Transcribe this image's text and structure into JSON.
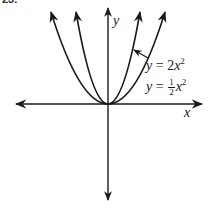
{
  "figure": {
    "problem_number": "23.",
    "axes": {
      "x_label": "x",
      "y_label": "y"
    },
    "curves": [
      {
        "name": "y = 2x^2",
        "label_lhs": "y",
        "label_eq": "=",
        "label_coef": "2",
        "label_var": "x",
        "label_exp": "2",
        "color": "#1a1a1a"
      },
      {
        "name": "y = 1/2 x^2",
        "label_lhs": "y",
        "label_eq": "=",
        "label_num": "1",
        "label_den": "2",
        "label_var": "x",
        "label_exp": "2",
        "color": "#1a1a1a"
      }
    ],
    "colors": {
      "ink": "#1a1a1a",
      "background": "#ffffff"
    }
  }
}
